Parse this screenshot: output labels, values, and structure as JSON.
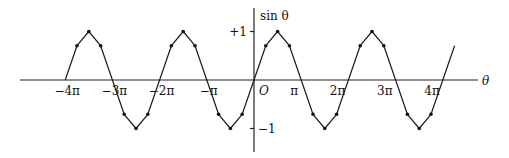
{
  "chart_data": {
    "type": "line",
    "title": "",
    "xlabel": "θ",
    "ylabel": "sin θ",
    "xlim_pi": [
      -4.4,
      4.4
    ],
    "ylim": [
      -1.5,
      1.5
    ],
    "grid": false,
    "legend": "none",
    "origin_label": "O",
    "x_ticks": [
      {
        "value_pi": -4,
        "label": "−4π"
      },
      {
        "value_pi": -3,
        "label": "−3π"
      },
      {
        "value_pi": -2,
        "label": "−2π"
      },
      {
        "value_pi": -1,
        "label": "−π"
      },
      {
        "value_pi": 1,
        "label": "π"
      },
      {
        "value_pi": 2,
        "label": "2π"
      },
      {
        "value_pi": 3,
        "label": "3π"
      },
      {
        "value_pi": 4,
        "label": "4π"
      }
    ],
    "y_ticks": [
      {
        "value": 1,
        "label": "+1"
      },
      {
        "value": -1,
        "label": "−1"
      }
    ],
    "series": [
      {
        "name": "sin θ (piecewise-linear approximation)",
        "x_pi_start": -4,
        "x_pi_end": 4.2,
        "step_pi": 0.25,
        "marked_points_note": "dots at θ = π/4, π/2, 3π/4 within each half-period (not at zero crossings)"
      }
    ]
  }
}
